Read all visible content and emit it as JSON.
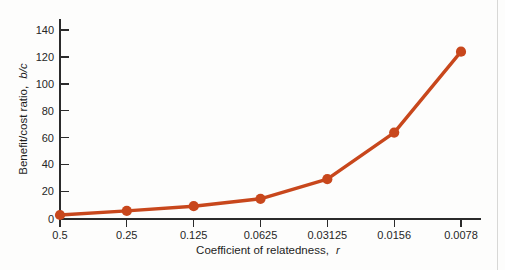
{
  "figure": {
    "name": "benefit-cost-ratio-vs-relatedness",
    "background_color": "#fdfdfc",
    "page_edge_color": "#d8d8d6"
  },
  "chart_data": {
    "type": "line",
    "title": "",
    "xlabel": "Coefficient of relatedness, r",
    "xlabel_plain": "Coefficient of relatedness,",
    "xlabel_italic": "r",
    "ylabel": "Benefit/cost ratio, b/c",
    "ylabel_plain": "Benefit/cost ratio,",
    "ylabel_italic": "b/c",
    "categories": [
      "0.5",
      "0.25",
      "0.125",
      "0.0625",
      "0.03125",
      "0.0156",
      "0.0078"
    ],
    "x": [
      0.5,
      0.25,
      0.125,
      0.0625,
      0.03125,
      0.0156,
      0.0078
    ],
    "values": [
      3,
      6,
      9.5,
      15,
      29.5,
      64,
      124
    ],
    "series": [
      {
        "name": "b/c threshold",
        "values": [
          3,
          6,
          9.5,
          15,
          29.5,
          64,
          124
        ],
        "color": "#c8471c",
        "marker": "circle",
        "marker_color": "#c8471c"
      }
    ],
    "yticks": [
      0,
      20,
      40,
      60,
      80,
      100,
      120,
      140
    ],
    "ytick_labels": [
      "0",
      "20",
      "40",
      "60",
      "80",
      "100",
      "120",
      "140"
    ],
    "ylim": [
      0,
      148
    ],
    "xlim_index": [
      0,
      6
    ],
    "grid": false,
    "legend": false,
    "legend_position": "none",
    "line_color": "#c8471c",
    "axis_color": "#2b2b2b"
  }
}
